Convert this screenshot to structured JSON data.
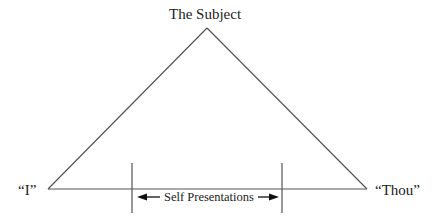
{
  "diagram": {
    "title": "The Subject",
    "vertices": {
      "apex": {
        "label": "The Subject",
        "x": 207,
        "y": 28
      },
      "left": {
        "label": "“I”",
        "x": 48,
        "y": 189
      },
      "right": {
        "label": "“Thou”",
        "x": 367,
        "y": 189
      }
    },
    "labels": {
      "top": "The Subject",
      "left": "“I”",
      "right": "“Thou”",
      "range": "Self Presentations"
    },
    "range_markers": {
      "left_x": 132,
      "right_x": 282,
      "y_top": 163,
      "y_bottom": 213,
      "arrow_y": 197
    },
    "colors": {
      "line": "#555555",
      "text": "#222222",
      "arrow": "#111111"
    }
  }
}
